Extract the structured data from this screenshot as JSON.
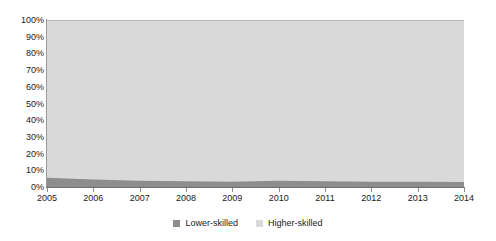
{
  "chart_data": {
    "type": "area",
    "title": "",
    "subtitle": "",
    "xlabel": "",
    "ylabel": "",
    "stacked": "100%",
    "grid": false,
    "legend_position": "bottom-center",
    "xlim": [
      2005,
      2014
    ],
    "ylim": [
      0,
      100
    ],
    "x": [
      2005,
      2006,
      2007,
      2008,
      2009,
      2010,
      2011,
      2012,
      2013,
      2014
    ],
    "categories": [
      "2005",
      "2006",
      "2007",
      "2008",
      "2009",
      "2010",
      "2011",
      "2012",
      "2013",
      "2014"
    ],
    "ytick_labels": [
      "0%",
      "10%",
      "20%",
      "30%",
      "40%",
      "50%",
      "60%",
      "70%",
      "80%",
      "90%",
      "100%"
    ],
    "ytick_values": [
      0,
      10,
      20,
      30,
      40,
      50,
      60,
      70,
      80,
      90,
      100
    ],
    "series": [
      {
        "name": "Lower-skilled",
        "color": "#8d8d8d",
        "values": [
          5.5,
          4.5,
          3.8,
          3.4,
          3.2,
          3.8,
          3.4,
          3.2,
          3.1,
          3.0
        ]
      },
      {
        "name": "Higher-skilled",
        "color": "#d9d9d9",
        "values": [
          94.5,
          95.5,
          96.2,
          96.6,
          96.8,
          96.2,
          96.6,
          96.8,
          96.9,
          97.0
        ]
      }
    ]
  },
  "legend": {
    "items": [
      {
        "label": "Lower-skilled",
        "color": "#8d8d8d"
      },
      {
        "label": "Higher-skilled",
        "color": "#d9d9d9"
      }
    ]
  },
  "axes": {
    "y_labels": [
      "100%",
      "90%",
      "80%",
      "70%",
      "60%",
      "50%",
      "40%",
      "30%",
      "20%",
      "10%",
      "0%"
    ],
    "x_labels": [
      "2005",
      "2006",
      "2007",
      "2008",
      "2009",
      "2010",
      "2011",
      "2012",
      "2013",
      "2014"
    ]
  }
}
